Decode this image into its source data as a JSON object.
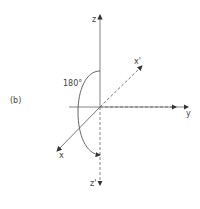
{
  "figure": {
    "panel_label": "(b)",
    "axes": {
      "z": "z",
      "z_prime": "z'",
      "y": "y",
      "x": "x",
      "x_prime": "x'"
    },
    "rotation_label": "180°",
    "colors": {
      "line": "#555555",
      "background": "#ffffff"
    }
  }
}
